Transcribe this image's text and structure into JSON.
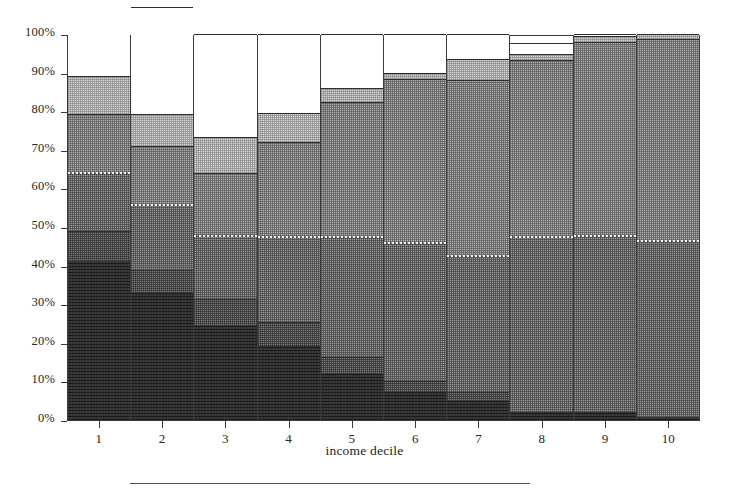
{
  "chart_data": {
    "type": "bar",
    "title": "",
    "subtitle": "",
    "xlabel": "income decile",
    "ylabel": "",
    "categories": [
      "1",
      "2",
      "3",
      "4",
      "5",
      "6",
      "7",
      "8",
      "9",
      "10"
    ],
    "ytick_labels": [
      "0%",
      "10%",
      "20%",
      "30%",
      "40%",
      "50%",
      "60%",
      "70%",
      "80%",
      "90%",
      "100%"
    ],
    "ytick_values": [
      0,
      10,
      20,
      30,
      40,
      50,
      60,
      70,
      80,
      90,
      100
    ],
    "ylim": [
      0,
      100
    ],
    "stacked": true,
    "stack_order": "bottom-to-top",
    "grid": false,
    "legend": "none",
    "units": "percent",
    "series": [
      {
        "name": "segment-1-darkest",
        "fill": "darkest-speckle",
        "color": "#333333",
        "values": [
          41.2,
          32.9,
          24.4,
          19.2,
          11.9,
          7.3,
          4.9,
          2.1,
          2.1,
          0.8
        ]
      },
      {
        "name": "segment-2-dark-gray",
        "fill": "dark-gray-checker",
        "color": "#7d7d7d",
        "values": [
          7.8,
          6.0,
          6.9,
          6.2,
          4.4,
          2.8,
          2.4,
          0.0,
          0.0,
          0.0
        ]
      },
      {
        "name": "segment-3-medium-gray",
        "fill": "medium-gray-checker",
        "color": "#9a9a9a",
        "values": [
          15.2,
          17.0,
          16.6,
          22.3,
          31.3,
          36.0,
          35.5,
          45.5,
          45.8,
          45.8
        ]
      },
      {
        "name": "segment-4-light-medium-gray",
        "fill": "medium-gray-checker-2",
        "color": "#b0b0b0",
        "values": [
          15.2,
          15.0,
          16.1,
          24.3,
          34.8,
          42.2,
          45.3,
          45.7,
          50.0,
          52.1
        ]
      },
      {
        "name": "segment-5-light-gray",
        "fill": "light-gray-checker",
        "color": "#d8d8d8",
        "values": [
          9.6,
          8.5,
          9.3,
          7.5,
          3.6,
          1.6,
          5.4,
          1.6,
          1.6,
          1.3
        ]
      },
      {
        "name": "segment-6-white",
        "fill": "white-blank",
        "color": "#ffffff",
        "values": [
          26.2,
          27.5,
          26.7,
          20.5,
          14.0,
          10.1,
          6.5,
          2.8,
          0.5,
          0.0
        ]
      }
    ],
    "cumulative_tops": [
      [
        41.2,
        49.0,
        64.2,
        73.8,
        73.8,
        100.0
      ],
      [
        32.9,
        38.9,
        55.9,
        72.5,
        72.5,
        100.0
      ],
      [
        24.4,
        31.3,
        47.9,
        64.0,
        73.3,
        100.0
      ],
      [
        19.2,
        25.4,
        47.7,
        72.0,
        79.5,
        100.0
      ],
      [
        11.9,
        16.3,
        47.6,
        82.4,
        86.0,
        100.0
      ],
      [
        7.3,
        10.1,
        46.1,
        88.3,
        89.9,
        100.0
      ],
      [
        4.9,
        7.3,
        42.8,
        88.1,
        93.5,
        100.0
      ],
      [
        2.1,
        2.1,
        47.6,
        93.3,
        97.2,
        100.0
      ],
      [
        2.1,
        2.1,
        47.9,
        97.9,
        99.5,
        100.0
      ],
      [
        0.8,
        0.8,
        46.6,
        98.7,
        100.0,
        100.0
      ]
    ]
  },
  "axes": {
    "x_title": "income decile"
  }
}
